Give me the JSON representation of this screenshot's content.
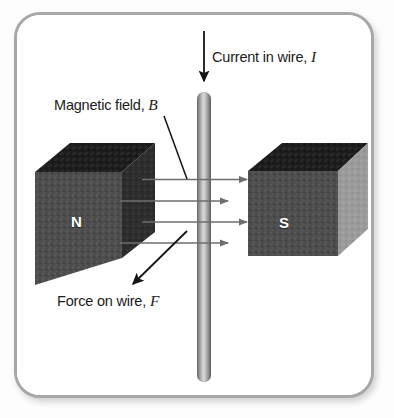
{
  "diagram": {
    "background_color": "#ffffff",
    "frame_color": "#a7a7a7"
  },
  "labels": {
    "current": {
      "text": "Current in wire,",
      "symbol": "I"
    },
    "magnetic_field": {
      "text": "Magnetic field,",
      "symbol": "B"
    },
    "force": {
      "text": "Force on wire,",
      "symbol": "F"
    }
  },
  "magnets": {
    "north": {
      "pole": "N",
      "face_color": "#4a4a4a",
      "top_color": "#1e1e1e",
      "side_color": "#2a2a2a"
    },
    "south": {
      "pole": "S",
      "face_color": "#4a4a4a",
      "top_color": "#1e1e1e",
      "side_color": "#9a9a9a"
    }
  },
  "wire": {
    "name": "wire",
    "color": "#9a9a9a"
  },
  "arrows": {
    "current_direction": "down",
    "force_direction": "down-left",
    "field_direction": "left-to-right",
    "field_arrow_count": 4,
    "arrow_color": "#6e6e6e",
    "annotation_arrow_color": "#1b1b1b"
  }
}
